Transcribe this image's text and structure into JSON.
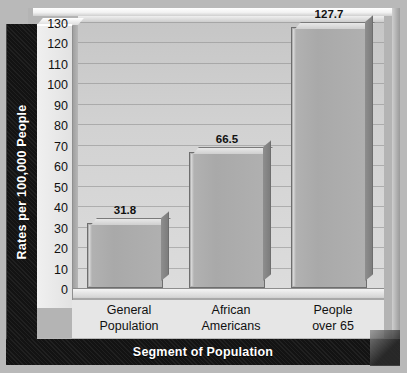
{
  "chart_data": {
    "type": "bar",
    "title": "",
    "subtitle": "",
    "xlabel": "Segment of Population",
    "ylabel": "Rates per 100,000 People",
    "categories": [
      "General\nPopulation",
      "African\nAmericans",
      "People\nover 65"
    ],
    "values": [
      31.8,
      66.5,
      127.7
    ],
    "value_labels": [
      "31.8",
      "66.5",
      "127.7"
    ],
    "ylim": [
      0,
      130
    ],
    "ytick_labels": [
      "130",
      "120",
      "110",
      "100",
      "90",
      "80",
      "70",
      "60",
      "50",
      "40",
      "30",
      "20",
      "10",
      "0"
    ],
    "ytick_values": [
      130,
      120,
      110,
      100,
      90,
      80,
      70,
      60,
      50,
      40,
      30,
      20,
      10,
      0
    ],
    "grid": true,
    "legend": false,
    "legend_position": "none",
    "style": "3d-extruded-bars",
    "colors": {
      "bar_face": "#ababab",
      "bar_top": "#e8e8e8",
      "bar_side": "#868686",
      "plot_background": "#d2d2d2",
      "band_background": "#141414",
      "band_text": "#ffffff",
      "text": "#111111",
      "gridline": "#8c8c8c",
      "frame": "#b4b4b4",
      "outer_border": "#1b1b1b"
    }
  }
}
